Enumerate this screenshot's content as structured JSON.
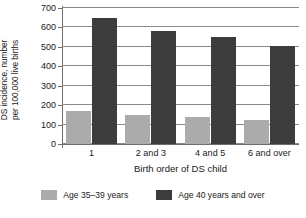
{
  "chart_data": {
    "type": "bar",
    "title": "",
    "xlabel": "Birth order of DS child",
    "ylabel": "DS incidence, number\nper 100,000 live births",
    "categories": [
      "1",
      "2 and 3",
      "4 and 5",
      "6 and over"
    ],
    "series": [
      {
        "name": "Age 35–39 years",
        "color": "#ababab",
        "values": [
          168,
          150,
          137,
          122
        ]
      },
      {
        "name": "Age 40 years and over",
        "color": "#3c3c3c",
        "values": [
          650,
          583,
          553,
          503
        ]
      }
    ],
    "ylim": [
      0,
      700
    ],
    "yticks": [
      0,
      100,
      200,
      300,
      400,
      500,
      600,
      700
    ],
    "ytick_labels": [
      "0",
      "100",
      "200",
      "300",
      "400",
      "500",
      "600",
      "700"
    ],
    "grid": "horizontal",
    "legend_position": "bottom"
  }
}
